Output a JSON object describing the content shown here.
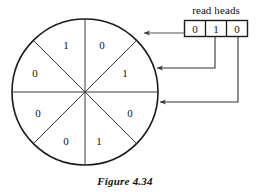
{
  "figure": {
    "caption": "Figure 4.34",
    "colors": {
      "ink": "#111111",
      "line": "#444444",
      "background": "#ffffff"
    }
  },
  "read_heads": {
    "label": "read heads",
    "cells": [
      {
        "value": "0"
      },
      {
        "value": "1"
      },
      {
        "value": "0"
      }
    ]
  },
  "disk": {
    "name": "rotating-disk",
    "sector_count": 8,
    "sectors": [
      {
        "position": "top-right",
        "value": "0",
        "x": 102,
        "y": 45
      },
      {
        "position": "right-upper",
        "value": "1",
        "x": 125,
        "y": 73
      },
      {
        "position": "right-lower",
        "value": "0",
        "x": 130,
        "y": 113
      },
      {
        "position": "bottom-right",
        "value": "1",
        "x": 99,
        "y": 141
      },
      {
        "position": "bottom-left",
        "value": "0",
        "x": 66,
        "y": 141
      },
      {
        "position": "left-lower",
        "value": "0",
        "x": 38,
        "y": 113
      },
      {
        "position": "left-upper",
        "value": "0",
        "x": 35,
        "y": 73
      },
      {
        "position": "top-left",
        "value": "1",
        "x": 66,
        "y": 45
      }
    ]
  },
  "connectors": [
    {
      "name": "head-1-to-disk",
      "from_cell": 0,
      "arrow_y": 33
    },
    {
      "name": "head-2-to-disk",
      "from_cell": 1,
      "arrow_y": 68
    },
    {
      "name": "head-3-to-disk",
      "from_cell": 2,
      "arrow_y": 102
    }
  ]
}
